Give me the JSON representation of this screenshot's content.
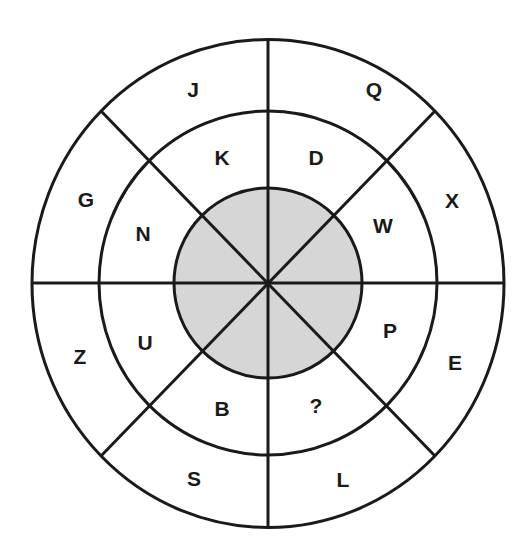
{
  "puzzle": {
    "type": "circular letter puzzle",
    "center_fill": "#d6d6d6",
    "line_color": "#1a1a1a",
    "outer_ring": [
      "J",
      "Q",
      "X",
      "E",
      "L",
      "S",
      "Z",
      "G"
    ],
    "inner_ring": [
      "K",
      "D",
      "W",
      "P",
      "?",
      "B",
      "U",
      "N"
    ],
    "labels": {
      "J": "J",
      "Q": "Q",
      "X": "X",
      "E": "E",
      "L": "L",
      "S": "S",
      "Z": "Z",
      "G": "G",
      "K": "K",
      "D": "D",
      "W": "W",
      "P": "P",
      "missing": "?",
      "B": "B",
      "U": "U",
      "N": "N"
    }
  }
}
